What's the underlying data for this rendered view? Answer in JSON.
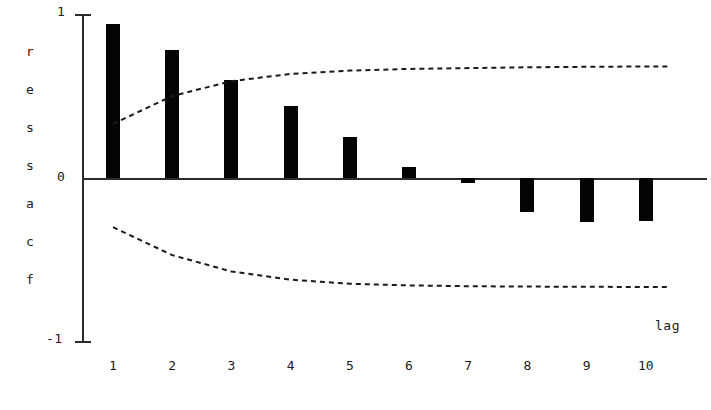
{
  "chart_data": {
    "type": "bar",
    "title": "",
    "subtitle": "",
    "xlabel": "lag",
    "ylabel": "res sacf",
    "ylabel_chars": [
      "r",
      "e",
      "s",
      "s",
      "a",
      "c",
      "f"
    ],
    "categories": [
      "1",
      "2",
      "3",
      "4",
      "5",
      "6",
      "7",
      "8",
      "9",
      "10"
    ],
    "x": [
      1,
      2,
      3,
      4,
      5,
      6,
      7,
      8,
      9,
      10
    ],
    "values": [
      0.94,
      0.78,
      0.6,
      0.44,
      0.25,
      0.07,
      -0.03,
      -0.21,
      -0.27,
      -0.26
    ],
    "ylim": [
      -1,
      1
    ],
    "xlim": [
      0.5,
      10.5
    ],
    "ytick_labels": [
      "1",
      "0",
      "-1"
    ],
    "ytick_values": [
      1,
      0,
      -1
    ],
    "grid": false,
    "legend": "none",
    "bar_color": "#050505",
    "axis_color": "#2b2b2b",
    "band_color": "#1a1a1a",
    "series": [
      {
        "name": "res sacf",
        "type": "bar",
        "values": [
          0.94,
          0.78,
          0.6,
          0.44,
          0.25,
          0.07,
          -0.03,
          -0.21,
          -0.27,
          -0.26
        ]
      },
      {
        "name": "upper confidence band",
        "type": "line",
        "style": "dashed",
        "values": [
          0.33,
          0.5,
          0.59,
          0.635,
          0.655,
          0.665,
          0.67,
          0.675,
          0.678,
          0.68
        ]
      },
      {
        "name": "lower confidence band",
        "type": "line",
        "style": "dashed",
        "values": [
          -0.3,
          -0.47,
          -0.57,
          -0.62,
          -0.645,
          -0.655,
          -0.66,
          -0.662,
          -0.663,
          -0.665
        ]
      }
    ],
    "annotations": [
      {
        "text": "lag",
        "x": 10.4,
        "y": -0.85
      }
    ]
  }
}
